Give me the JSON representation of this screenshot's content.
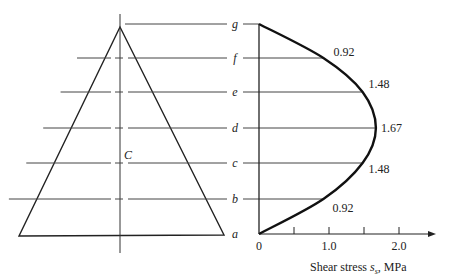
{
  "diagram": {
    "centroid_label": "C",
    "levels": [
      {
        "label": "g",
        "shear_stress": 0
      },
      {
        "label": "f",
        "shear_stress": 0.92,
        "value_text": "0.92"
      },
      {
        "label": "e",
        "shear_stress": 1.48,
        "value_text": "1.48"
      },
      {
        "label": "d",
        "shear_stress": 1.67,
        "value_text": "1.67"
      },
      {
        "label": "c",
        "shear_stress": 1.48,
        "value_text": "1.48"
      },
      {
        "label": "b",
        "shear_stress": 0.92,
        "value_text": "0.92"
      },
      {
        "label": "a",
        "shear_stress": 0
      }
    ],
    "axis": {
      "tick_labels": [
        "0",
        "1.0",
        "2.0"
      ],
      "tick_values": [
        0,
        0.5,
        1.0,
        1.5,
        2.0
      ],
      "xlabel_prefix": "Shear stress ",
      "xlabel_symbol": "s",
      "xlabel_sub": "s",
      "xlabel_suffix": ", MPa",
      "xlim": [
        0,
        2.5
      ]
    },
    "colors": {
      "ink": "#222222",
      "curve": "#111111"
    }
  },
  "chart_data": {
    "type": "line",
    "title": "",
    "xlabel": "Shear stress s_s, MPa",
    "ylabel": "",
    "categories": [
      "a",
      "b",
      "c",
      "d",
      "e",
      "f",
      "g"
    ],
    "x": [
      0,
      0.92,
      1.48,
      1.67,
      1.48,
      0.92,
      0
    ],
    "xlim": [
      0,
      2.5
    ],
    "xticks": [
      0,
      1.0,
      2.0
    ],
    "data_labels": [
      "",
      "0.92",
      "1.48",
      "1.67",
      "1.48",
      "0.92",
      ""
    ]
  }
}
